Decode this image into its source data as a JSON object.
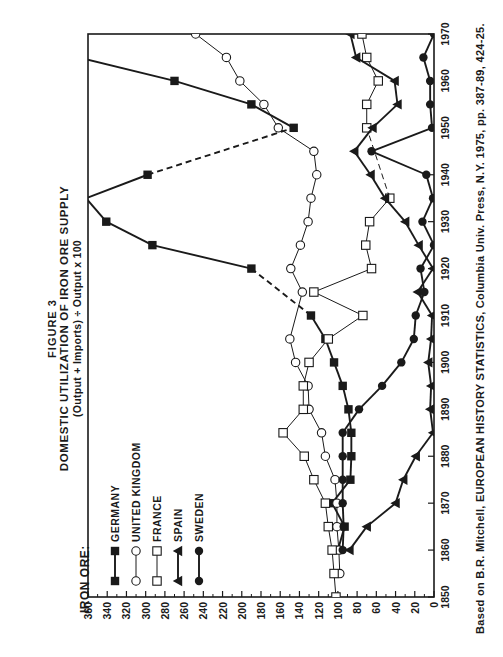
{
  "header": {
    "label": "IRON ORE:",
    "figure": "FIGURE 3",
    "title": "DOMESTIC UTILIZATION OF IRON ORE SUPPLY",
    "subtitle": "(Output + Imports) ÷ Output x 100"
  },
  "footer": {
    "source": "Based on B.R. Mitchell, EUROPEAN HISTORY STATISTICS, Columbia Univ. Press, N.Y. 1975, pp. 387-89, 424-25."
  },
  "chart_data": {
    "type": "line",
    "title": "DOMESTIC UTILIZATION OF IRON ORE SUPPLY",
    "subtitle": "(Output + Imports) ÷ Output x 100",
    "xlabel": "",
    "ylabel": "",
    "xlim": [
      1850,
      1970
    ],
    "ylim": [
      0,
      360
    ],
    "x_ticks": [
      1850,
      1860,
      1870,
      1880,
      1890,
      1900,
      1910,
      1920,
      1930,
      1940,
      1950,
      1960,
      1970
    ],
    "y_ticks": [
      0,
      20,
      40,
      60,
      80,
      100,
      120,
      140,
      160,
      180,
      200,
      220,
      240,
      260,
      280,
      300,
      320,
      340,
      360
    ],
    "grid": false,
    "orientation": "rotated 90° counterclockwise on page",
    "legend_position": "upper-left (inside plot)",
    "series": [
      {
        "name": "GERMANY",
        "marker": "filled-square",
        "line": "thick",
        "points": [
          [
            1860,
            100
          ],
          [
            1865,
            93
          ],
          [
            1870,
            106
          ],
          [
            1875,
            87
          ],
          [
            1880,
            86
          ],
          [
            1885,
            86
          ],
          [
            1890,
            89
          ],
          [
            1895,
            95
          ],
          [
            1900,
            104
          ],
          [
            1905,
            113
          ],
          [
            1910,
            128
          ],
          [
            1920,
            190
          ],
          [
            1925,
            293
          ],
          [
            1930,
            341
          ],
          [
            1935,
            362
          ],
          [
            1940,
            298
          ],
          [
            1950,
            146
          ],
          [
            1955,
            190
          ],
          [
            1960,
            270
          ],
          [
            1965,
            370
          ]
        ],
        "dashed_segments": [
          [
            1910,
            1920
          ],
          [
            1940,
            1950
          ]
        ]
      },
      {
        "name": "UNITED KINGDOM",
        "marker": "open-circle",
        "line": "thin",
        "points": [
          [
            1855,
            98
          ],
          [
            1860,
            99
          ],
          [
            1865,
            101
          ],
          [
            1870,
            101
          ],
          [
            1875,
            103
          ],
          [
            1880,
            113
          ],
          [
            1885,
            117
          ],
          [
            1890,
            130
          ],
          [
            1895,
            131
          ],
          [
            1900,
            144
          ],
          [
            1905,
            150
          ],
          [
            1915,
            137
          ],
          [
            1920,
            149
          ],
          [
            1925,
            139
          ],
          [
            1930,
            131
          ],
          [
            1935,
            128
          ],
          [
            1940,
            122
          ],
          [
            1945,
            125
          ],
          [
            1950,
            162
          ],
          [
            1955,
            177
          ],
          [
            1960,
            202
          ],
          [
            1965,
            216
          ],
          [
            1970,
            248
          ]
        ],
        "dashed_segments": []
      },
      {
        "name": "FRANCE",
        "marker": "open-square",
        "line": "thin",
        "points": [
          [
            1850,
            102
          ],
          [
            1855,
            104
          ],
          [
            1860,
            106
          ],
          [
            1865,
            110
          ],
          [
            1870,
            113
          ],
          [
            1875,
            125
          ],
          [
            1880,
            135
          ],
          [
            1885,
            157
          ],
          [
            1890,
            136
          ],
          [
            1895,
            136
          ],
          [
            1900,
            130
          ],
          [
            1905,
            110
          ],
          [
            1910,
            74
          ],
          [
            1915,
            125
          ],
          [
            1920,
            65
          ],
          [
            1925,
            71
          ],
          [
            1930,
            67
          ],
          [
            1935,
            46
          ],
          [
            1950,
            70
          ],
          [
            1955,
            70
          ],
          [
            1960,
            58
          ],
          [
            1965,
            70
          ],
          [
            1970,
            75
          ]
        ],
        "dashed_segments": [
          [
            1935,
            1950
          ]
        ]
      },
      {
        "name": "SPAIN",
        "marker": "filled-triangle",
        "line": "thick",
        "points": [
          [
            1860,
            88
          ],
          [
            1865,
            70
          ],
          [
            1870,
            40
          ],
          [
            1875,
            32
          ],
          [
            1880,
            19
          ],
          [
            1885,
            1
          ],
          [
            1890,
            4
          ],
          [
            1895,
            3
          ],
          [
            1900,
            6
          ],
          [
            1905,
            3
          ],
          [
            1910,
            2
          ],
          [
            1915,
            17
          ],
          [
            1920,
            1
          ],
          [
            1925,
            16
          ],
          [
            1930,
            30
          ],
          [
            1935,
            51
          ],
          [
            1940,
            66
          ],
          [
            1945,
            83
          ],
          [
            1950,
            64
          ],
          [
            1955,
            38
          ],
          [
            1960,
            41
          ],
          [
            1965,
            81
          ],
          [
            1970,
            87
          ]
        ],
        "dashed_segments": []
      },
      {
        "name": "SWEDEN",
        "marker": "filled-circle",
        "line": "thick",
        "points": [
          [
            1860,
            95
          ],
          [
            1865,
            94
          ],
          [
            1870,
            95
          ],
          [
            1875,
            95
          ],
          [
            1880,
            95
          ],
          [
            1885,
            95
          ],
          [
            1890,
            78
          ],
          [
            1895,
            54
          ],
          [
            1900,
            34
          ],
          [
            1905,
            21
          ],
          [
            1910,
            19
          ],
          [
            1915,
            10
          ],
          [
            1920,
            14
          ],
          [
            1925,
            0
          ],
          [
            1930,
            12
          ],
          [
            1935,
            1
          ],
          [
            1940,
            8
          ],
          [
            1945,
            65
          ],
          [
            1950,
            2
          ],
          [
            1955,
            4
          ],
          [
            1960,
            4
          ],
          [
            1965,
            11
          ],
          [
            1970,
            0
          ]
        ],
        "dashed_segments": []
      }
    ]
  }
}
